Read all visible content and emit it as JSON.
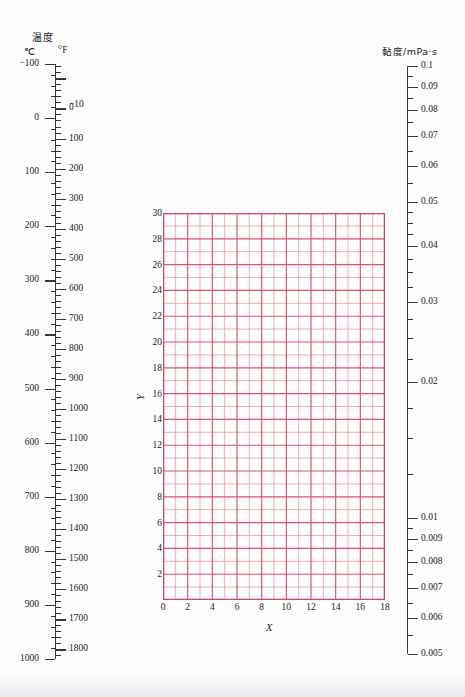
{
  "temperature_scale": {
    "title": "温度",
    "unit_left": "℃",
    "unit_right": "°F",
    "celsius_labels": [
      -100,
      0,
      100,
      200,
      300,
      400,
      500,
      600,
      700,
      800,
      900,
      1000
    ],
    "fahrenheit_labels": [
      -10,
      0,
      100,
      200,
      300,
      400,
      500,
      600,
      700,
      800,
      900,
      1000,
      1100,
      1200,
      1300,
      1400,
      1500,
      1600,
      1700,
      1800
    ],
    "celsius_range": [
      -100,
      1000
    ],
    "fahrenheit_range": [
      -148,
      1832
    ]
  },
  "viscosity_scale": {
    "title": "黏度/mPa·s",
    "labels": [
      "0.1",
      "0.09",
      "0.08",
      "0.07",
      "0.06",
      "0.05",
      "0.04",
      "0.03",
      "0.02",
      "0.01",
      "0.009",
      "0.008",
      "0.007",
      "0.006",
      "0.005"
    ],
    "values": [
      0.1,
      0.09,
      0.08,
      0.07,
      0.06,
      0.05,
      0.04,
      0.03,
      0.02,
      0.01,
      0.009,
      0.008,
      0.007,
      0.006,
      0.005
    ],
    "type": "logarithmic",
    "range": [
      0.005,
      0.1
    ]
  },
  "chart_data": {
    "type": "table",
    "title": "",
    "subtitle": "",
    "xlabel": "X",
    "ylabel": "Y",
    "xlim": [
      0,
      18
    ],
    "ylim": [
      0,
      30
    ],
    "x_tick_labels": [
      "0",
      "2",
      "4",
      "6",
      "8",
      "10",
      "12",
      "14",
      "16",
      "18"
    ],
    "x_tick_values": [
      0,
      2,
      4,
      6,
      8,
      10,
      12,
      14,
      16,
      18
    ],
    "y_tick_labels": [
      "2",
      "4",
      "6",
      "8",
      "10",
      "12",
      "14",
      "16",
      "18",
      "20",
      "22",
      "24",
      "26",
      "28",
      "30"
    ],
    "y_tick_values": [
      2,
      4,
      6,
      8,
      10,
      12,
      14,
      16,
      18,
      20,
      22,
      24,
      26,
      28,
      30
    ],
    "x_minor_step": 1,
    "y_minor_step": 1,
    "x_major_step": 2,
    "y_major_step": 2,
    "grid": true,
    "legend": null,
    "series": [],
    "values": [],
    "categories": [],
    "grid_color_major": "#d9536b",
    "grid_color_minor": "#e79aa8",
    "frame_color": "#c94a62"
  },
  "colors": {
    "grid_major": "#d9536b",
    "grid_minor": "#e79aa8",
    "grid_frame": "#c94a62",
    "axis_ink": "#33363b",
    "page_background": "#fdfdfd"
  }
}
